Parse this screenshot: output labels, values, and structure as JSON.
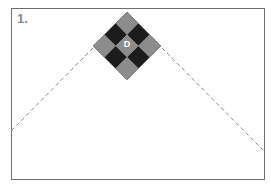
{
  "diagram": {
    "step_label": "1.",
    "block": {
      "center_letter": "D",
      "grid": [
        [
          "gray",
          "black",
          "gray"
        ],
        [
          "black",
          "gray",
          "black"
        ],
        [
          "gray",
          "black",
          "gray"
        ]
      ],
      "colors": {
        "gray": "#8c8c8c",
        "black": "#1c1c1c",
        "outline": "#555555"
      }
    },
    "lines": {
      "style": "dashed",
      "color": "#888888"
    },
    "frame_color": "#6e6e6e"
  }
}
